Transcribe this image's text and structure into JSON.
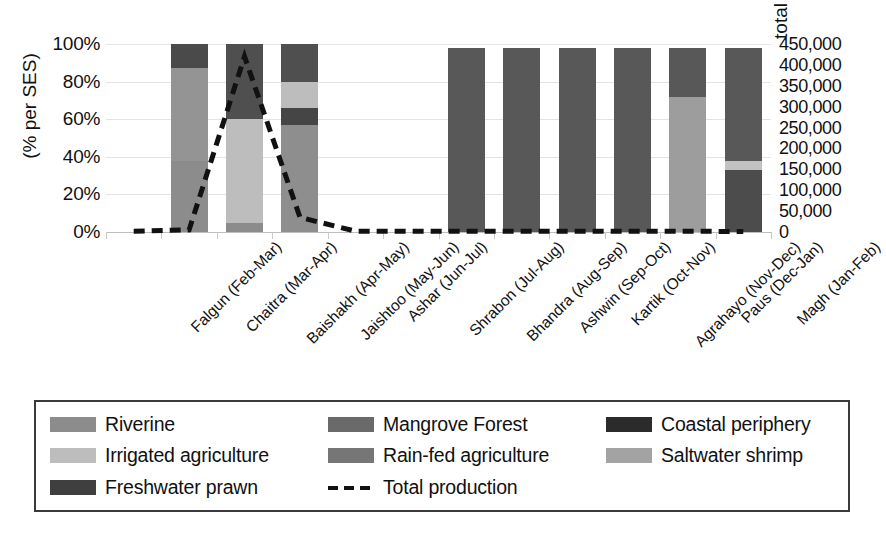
{
  "chart_data": {
    "type": "bar",
    "subtype": "stacked-bar-with-line-overlay",
    "title": "",
    "xlabel": "",
    "ylabel": "(% per SES)",
    "y2label": "total production (kg)",
    "ylim": [
      0,
      100
    ],
    "y2lim": [
      0,
      450000
    ],
    "yticks": [
      "0%",
      "20%",
      "40%",
      "60%",
      "80%",
      "100%"
    ],
    "ytick_values": [
      0,
      20,
      40,
      60,
      80,
      100
    ],
    "y2ticks": [
      "0",
      "50,000",
      "100,000",
      "150,000",
      "200,000",
      "250,000",
      "300,000",
      "350,000",
      "400,000",
      "450,000"
    ],
    "y2tick_values": [
      0,
      50000,
      100000,
      150000,
      200000,
      250000,
      300000,
      350000,
      400000,
      450000
    ],
    "grid": true,
    "legend_position": "bottom",
    "categories": [
      "Falgun (Feb-Mar)",
      "Chaitra (Mar-Apr)",
      "Baishakh (Apr-May)",
      "Jaishtoo (May-Jun)",
      "Ashar (Jun-Jul)",
      "Shrabon (Jul-Aug)",
      "Bhandra (Aug-Sep)",
      "Ashwin (Sep-Oct)",
      "Kartik (Oct-Nov)",
      "Agrahayo (Nov-Dec)",
      "Paus (Dec-Jan)",
      "Magh (Jan-Feb)"
    ],
    "series": [
      {
        "name": "Riverine",
        "color": "#8c8c8c",
        "values": [
          0,
          38,
          5,
          0,
          0,
          0,
          0,
          0,
          0,
          0,
          0,
          0
        ]
      },
      {
        "name": "Irrigated agriculture",
        "color": "#bfbfbf",
        "values": [
          0,
          0,
          0,
          0,
          0,
          0,
          0,
          0,
          0,
          0,
          0,
          0
        ]
      },
      {
        "name": "Freshwater prawn",
        "color": "#404040",
        "values": [
          0,
          0,
          0,
          0,
          0,
          0,
          0,
          0,
          0,
          0,
          0,
          0
        ]
      },
      {
        "name": "Mangrove Forest",
        "color": "#595959",
        "values": [
          0,
          49,
          0,
          0,
          0,
          0,
          98,
          98,
          98,
          98,
          0,
          0
        ]
      },
      {
        "name": "Rain-fed agriculture",
        "color": "#6e6e6e",
        "values": [
          0,
          0,
          0,
          57,
          0,
          0,
          0,
          0,
          0,
          0,
          0,
          0
        ]
      },
      {
        "name": "Coastal periphery",
        "color": "#2e2e2e",
        "values": [
          0,
          13,
          40,
          0,
          0,
          0,
          0,
          0,
          0,
          0,
          0,
          0
        ]
      },
      {
        "name": "Saltwater shrimp",
        "color": "#a0a0a0",
        "values": [
          0,
          0,
          55,
          0,
          0,
          0,
          0,
          0,
          0,
          0,
          72,
          0
        ]
      }
    ],
    "stacks": [
      {
        "category": "Falgun (Feb-Mar)",
        "segments": []
      },
      {
        "category": "Chaitra (Mar-Apr)",
        "segments": [
          {
            "name": "Riverine",
            "from": 0,
            "to": 38,
            "color": "#8c8c8c"
          },
          {
            "name": "Mangrove Forest",
            "from": 38,
            "to": 87,
            "color": "#949494"
          },
          {
            "name": "Coastal periphery",
            "from": 87,
            "to": 100,
            "color": "#4a4a4a"
          }
        ]
      },
      {
        "category": "Baishakh (Apr-May)",
        "segments": [
          {
            "name": "Riverine",
            "from": 0,
            "to": 5,
            "color": "#8c8c8c"
          },
          {
            "name": "Irrigated agriculture",
            "from": 5,
            "to": 60,
            "color": "#bdbdbd"
          },
          {
            "name": "Coastal periphery",
            "from": 60,
            "to": 100,
            "color": "#4f4f4f"
          }
        ]
      },
      {
        "category": "Jaishtoo (May-Jun)",
        "segments": [
          {
            "name": "Rain-fed agriculture",
            "from": 0,
            "to": 57,
            "color": "#8e8e8e"
          },
          {
            "name": "Freshwater prawn",
            "from": 57,
            "to": 66,
            "color": "#454545"
          },
          {
            "name": "Irrigated agriculture",
            "from": 66,
            "to": 80,
            "color": "#bdbdbd"
          },
          {
            "name": "Coastal periphery",
            "from": 80,
            "to": 100,
            "color": "#4f4f4f"
          }
        ]
      },
      {
        "category": "Ashar (Jun-Jul)",
        "segments": []
      },
      {
        "category": "Shrabon (Jul-Aug)",
        "segments": []
      },
      {
        "category": "Bhandra (Aug-Sep)",
        "segments": [
          {
            "name": "Mangrove Forest",
            "from": 0,
            "to": 98,
            "color": "#585858"
          }
        ]
      },
      {
        "category": "Ashwin (Sep-Oct)",
        "segments": [
          {
            "name": "Mangrove Forest",
            "from": 0,
            "to": 98,
            "color": "#585858"
          }
        ]
      },
      {
        "category": "Kartik (Oct-Nov)",
        "segments": [
          {
            "name": "Mangrove Forest",
            "from": 0,
            "to": 98,
            "color": "#585858"
          }
        ]
      },
      {
        "category": "Agrahayo (Nov-Dec)",
        "segments": [
          {
            "name": "Mangrove Forest",
            "from": 0,
            "to": 98,
            "color": "#585858"
          }
        ]
      },
      {
        "category": "Paus (Dec-Jan)",
        "segments": [
          {
            "name": "Saltwater shrimp",
            "from": 0,
            "to": 72,
            "color": "#9d9d9d"
          },
          {
            "name": "Mangrove Forest",
            "from": 72,
            "to": 98,
            "color": "#585858"
          }
        ]
      },
      {
        "category": "Magh (Jan-Feb)",
        "segments": [
          {
            "name": "Freshwater prawn",
            "from": 0,
            "to": 33,
            "color": "#4c4c4c"
          },
          {
            "name": "Saltwater shrimp",
            "from": 33,
            "to": 38,
            "color": "#c2c2c2"
          },
          {
            "name": "Mangrove Forest",
            "from": 38,
            "to": 98,
            "color": "#585858"
          }
        ]
      }
    ],
    "line_series": {
      "name": "Total production",
      "style": "dashed",
      "color": "#111111",
      "axis": "right",
      "values": [
        2000,
        5000,
        420000,
        35000,
        2000,
        2000,
        2000,
        2000,
        2000,
        2000,
        2000,
        1000
      ]
    }
  },
  "axes": {
    "left_title": "(% per SES)",
    "right_title": "total production (kg)"
  },
  "legend": {
    "entries": [
      {
        "label": "Riverine",
        "color": "#8c8c8c",
        "type": "swatch"
      },
      {
        "label": "Mangrove Forest",
        "color": "#6a6a6a",
        "type": "swatch"
      },
      {
        "label": "Coastal periphery",
        "color": "#2b2b2b",
        "type": "swatch"
      },
      {
        "label": "Irrigated agriculture",
        "color": "#bdbdbd",
        "type": "swatch"
      },
      {
        "label": "Rain-fed agriculture",
        "color": "#767676",
        "type": "swatch"
      },
      {
        "label": "Saltwater shrimp",
        "color": "#a3a3a3",
        "type": "swatch"
      },
      {
        "label": "Freshwater prawn",
        "color": "#3f3f3f",
        "type": "swatch"
      },
      {
        "label": "Total production",
        "color": "#111111",
        "type": "dashed-line"
      }
    ]
  }
}
